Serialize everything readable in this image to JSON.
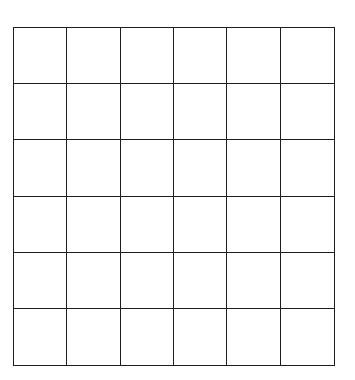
{
  "grid": {
    "rows": 6,
    "columns": 6,
    "line_color": "#1e1e1e",
    "background_color": "#ffffff",
    "cells": [
      [
        "",
        "",
        "",
        "",
        "",
        ""
      ],
      [
        "",
        "",
        "",
        "",
        "",
        ""
      ],
      [
        "",
        "",
        "",
        "",
        "",
        ""
      ],
      [
        "",
        "",
        "",
        "",
        "",
        ""
      ],
      [
        "",
        "",
        "",
        "",
        "",
        ""
      ],
      [
        "",
        "",
        "",
        "",
        "",
        ""
      ]
    ]
  }
}
